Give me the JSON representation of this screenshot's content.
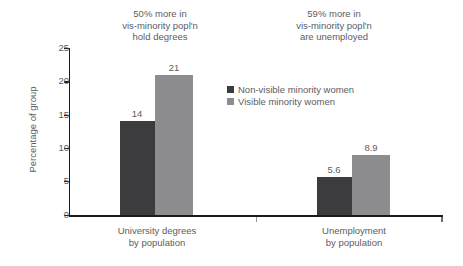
{
  "chart_data": {
    "type": "bar",
    "title": "",
    "subtitle": "",
    "xlabel": "",
    "ylabel": "Percentage of group",
    "ylim": [
      0,
      25
    ],
    "yticks": [
      0,
      5,
      10,
      15,
      20,
      25
    ],
    "ytick_labels": [
      "0",
      "5",
      "10",
      "15",
      "20",
      "25"
    ],
    "grid": false,
    "legend_position": "center-top-right",
    "categories": [
      "University degrees\nby population",
      "Unemployment\nby population"
    ],
    "series": [
      {
        "name": "Non-visible minority women",
        "color": "#3c3c3e",
        "values": [
          14,
          5.6
        ],
        "value_labels": [
          "14",
          "5.6"
        ]
      },
      {
        "name": "Visible minority women",
        "color": "#8d8d8f",
        "values": [
          21,
          8.9
        ],
        "value_labels": [
          "21",
          "8.9"
        ]
      }
    ],
    "annotations": [
      "50% more in\nvis-minority popl'n\nhold degrees",
      "59% more in\nvis-minority popl'n\nare unemployed"
    ]
  },
  "axis": {
    "y_title": "Percentage of group",
    "tick_0": "0",
    "tick_1": "5",
    "tick_2": "10",
    "tick_3": "15",
    "tick_4": "20",
    "tick_5": "25"
  },
  "annotations": {
    "degrees": "50% more in\nvis-minority popl'n\nhold degrees",
    "unemployment": "59% more in\nvis-minority popl'n\nare unemployed"
  },
  "categories": {
    "degrees": "University degrees\nby population",
    "unemployment": "Unemployment\nby population"
  },
  "legend": {
    "items": [
      {
        "label": "Non-visible minority women",
        "color": "#3c3c3e"
      },
      {
        "label": "Visible minority women",
        "color": "#8d8d8f"
      }
    ]
  },
  "bars": {
    "g0_dark_label": "14",
    "g0_light_label": "21",
    "g1_dark_label": "5.6",
    "g1_light_label": "8.9"
  },
  "colors": {
    "non_visible": "#3c3c3e",
    "visible": "#8d8d8f",
    "axis": "#1b1b1b",
    "text": "#5d5d5f",
    "background": "#ffffff"
  }
}
